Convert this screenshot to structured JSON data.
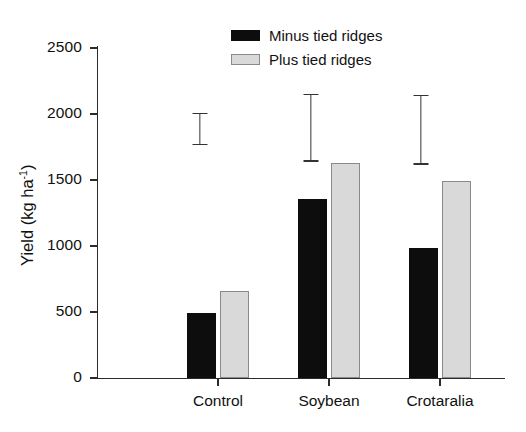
{
  "chart_data": {
    "type": "bar",
    "title": "",
    "xlabel": "",
    "ylabel": "Yield (kg ha-1)",
    "ylabel_base": "Yield (kg ha",
    "ylabel_sup": "-1",
    "ylabel_close": ")",
    "categories": [
      "Control",
      "Soybean",
      "Crotaralia"
    ],
    "series": [
      {
        "name": "Minus tied ridges",
        "color": "#0d0d0d",
        "values": [
          495,
          1355,
          985
        ]
      },
      {
        "name": "Plus tied ridges",
        "color": "#d9d9d9",
        "values": [
          660,
          1630,
          1492
        ]
      }
    ],
    "ylim": [
      0,
      2500
    ],
    "yticks": [
      0,
      500,
      1000,
      1500,
      2000,
      2500
    ],
    "ytick_labels": [
      "0",
      "500",
      "1000",
      "1500",
      "2000",
      "2500"
    ],
    "grid": false,
    "legend_position": "top-center",
    "error_bars": [
      {
        "group": "Control",
        "upper": 2010,
        "lower": 1765
      },
      {
        "group": "Soybean",
        "upper": 2155,
        "lower": 1640
      },
      {
        "group": "Crotaralia",
        "upper": 2145,
        "lower": 1615
      }
    ]
  },
  "legend": {
    "items": [
      {
        "label": "Minus tied ridges",
        "style": "minus"
      },
      {
        "label": "Plus tied ridges",
        "style": "plus"
      }
    ]
  }
}
